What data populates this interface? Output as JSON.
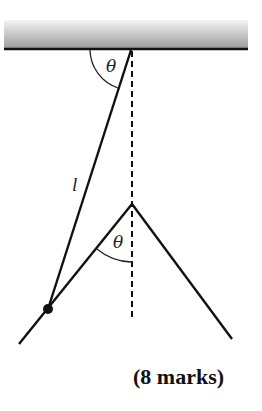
{
  "diagram": {
    "labels": {
      "top_angle": "θ",
      "lower_angle": "θ",
      "string_length": "l"
    },
    "footer": {
      "marks": "(8 marks)"
    },
    "colors": {
      "line": "#111111",
      "ceiling_dark": "#9a9a9a",
      "ceiling_light": "#e6e6e6"
    }
  }
}
